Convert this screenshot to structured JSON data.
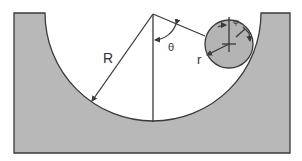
{
  "diagram": {
    "labels": {
      "big_radius": "R",
      "angle_theta": "θ",
      "small_radius": "r",
      "angle_psi": "ψ"
    },
    "colors": {
      "block_fill": "#b8b8b8",
      "ball_fill": "#b4b4b4",
      "stroke": "#3a3a3a",
      "background": "#ffffff"
    }
  }
}
